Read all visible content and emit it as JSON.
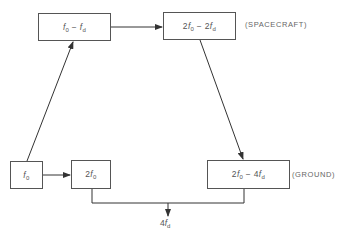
{
  "diagram": {
    "type": "signal flow block diagram",
    "colors": {
      "line": "#333333",
      "box_border": "#555555",
      "text": "#555555",
      "background": "#ffffff"
    },
    "nodes": [
      {
        "id": "f0",
        "coef": "",
        "var": "f",
        "sub": "0",
        "op": "",
        "coef2": "",
        "var2": "",
        "sub2": ""
      },
      {
        "id": "f0_minus_fd",
        "coef": "",
        "var": "f",
        "sub": "0",
        "op": " − ",
        "coef2": "",
        "var2": "f",
        "sub2": "d"
      },
      {
        "id": "2f0_minus_2fd",
        "coef": "2",
        "var": "f",
        "sub": "0",
        "op": " − ",
        "coef2": "2",
        "var2": "f",
        "sub2": "d"
      },
      {
        "id": "2f0",
        "coef": "2",
        "var": "f",
        "sub": "0",
        "op": "",
        "coef2": "",
        "var2": "",
        "sub2": ""
      },
      {
        "id": "2f0_minus_4fd",
        "coef": "2",
        "var": "f",
        "sub": "0",
        "op": " − ",
        "coef2": "4",
        "var2": "f",
        "sub2": "d"
      }
    ],
    "labels": {
      "spacecraft": "(SPACECRAFT)",
      "ground": "(GROUND)"
    },
    "output": {
      "coef": "4",
      "var": "f",
      "sub": "d"
    },
    "edges": [
      {
        "from": "f0",
        "to": "f0_minus_fd"
      },
      {
        "from": "f0_minus_fd",
        "to": "2f0_minus_2fd"
      },
      {
        "from": "2f0_minus_2fd",
        "to": "2f0_minus_4fd"
      },
      {
        "from": "f0",
        "to": "2f0"
      },
      {
        "from": "2f0",
        "to": "output_4fd",
        "via": "combine"
      },
      {
        "from": "2f0_minus_4fd",
        "to": "output_4fd",
        "via": "combine"
      }
    ]
  }
}
